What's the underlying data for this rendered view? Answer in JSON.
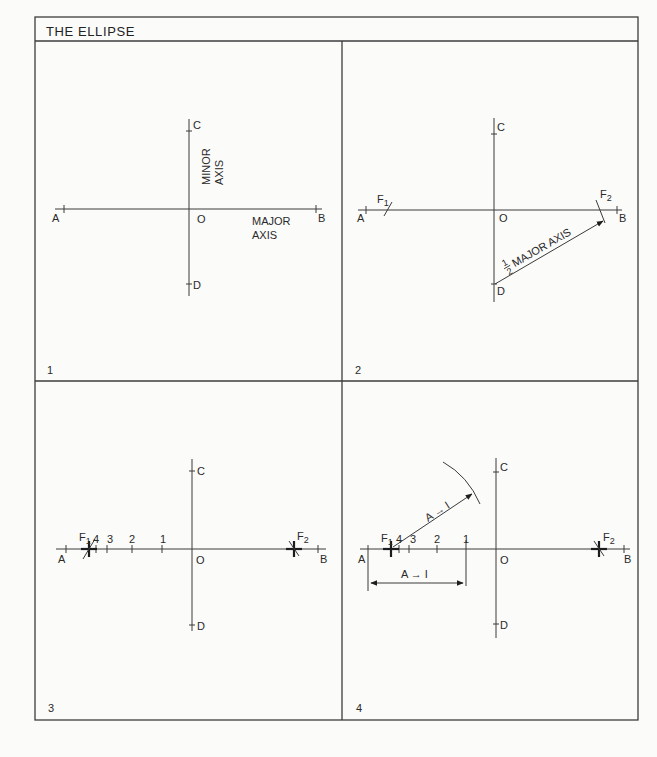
{
  "title": "THE ELLIPSE",
  "colors": {
    "ink": "#2a2a2a",
    "paper": "#fbfbfa"
  },
  "panels": [
    {
      "number": "1",
      "points": {
        "A": "A",
        "B": "B",
        "C": "C",
        "D": "D",
        "O": "O"
      },
      "labels": {
        "minor_axis_line1": "MINOR",
        "minor_axis_line2": "AXIS",
        "major_axis_line1": "MAJOR",
        "major_axis_line2": "AXIS"
      }
    },
    {
      "number": "2",
      "points": {
        "A": "A",
        "B": "B",
        "C": "C",
        "D": "D",
        "O": "O",
        "F1": "F",
        "F1_sub": "1",
        "F2": "F",
        "F2_sub": "2"
      },
      "labels": {
        "half_num": "1",
        "half_den": "2",
        "half_major_axis": "MAJOR AXIS"
      }
    },
    {
      "number": "3",
      "points": {
        "A": "A",
        "B": "B",
        "C": "C",
        "D": "D",
        "O": "O",
        "F1": "F",
        "F1_sub": "1",
        "F2": "F",
        "F2_sub": "2"
      },
      "divisions": [
        "4",
        "3",
        "2",
        "1"
      ]
    },
    {
      "number": "4",
      "points": {
        "A": "A",
        "B": "B",
        "C": "C",
        "D": "D",
        "O": "O",
        "F1": "F",
        "F1_sub": "1",
        "F2": "F",
        "F2_sub": "2"
      },
      "divisions": [
        "4",
        "3",
        "2",
        "1"
      ],
      "labels": {
        "radius_label": "A → I",
        "dimension_label": "A → I"
      }
    }
  ]
}
